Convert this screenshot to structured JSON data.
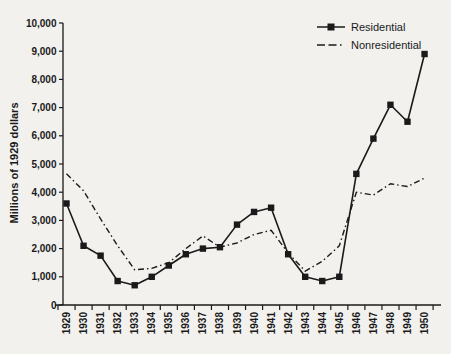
{
  "chart_data": {
    "type": "line",
    "title": "",
    "xlabel": "",
    "ylabel": "Millions of 1929 dollars",
    "ylim": [
      0,
      10000
    ],
    "ytick_step": 1000,
    "y_tick_labels": [
      "0",
      "1,000",
      "2,000",
      "3,000",
      "4,000",
      "5,000",
      "6,000",
      "7,000",
      "8,000",
      "9,000",
      "10,000"
    ],
    "categories": [
      "1929",
      "1930",
      "1931",
      "1932",
      "1933",
      "1934",
      "1935",
      "1936",
      "1937",
      "1938",
      "1939",
      "1940",
      "1941",
      "1942",
      "1943",
      "1944",
      "1945",
      "1946",
      "1947",
      "1948",
      "1949",
      "1950"
    ],
    "series": [
      {
        "name": "Residential",
        "line_style": "solid",
        "marker": "square",
        "values": [
          3600,
          2100,
          1750,
          850,
          700,
          1000,
          1400,
          1800,
          2000,
          2050,
          2850,
          3300,
          3450,
          1800,
          1000,
          850,
          1000,
          4650,
          5900,
          7100,
          6500,
          8900
        ]
      },
      {
        "name": "Nonresidential",
        "line_style": "dash-dot",
        "marker": "none",
        "values": [
          4650,
          4050,
          3050,
          2100,
          1250,
          1300,
          1500,
          2000,
          2450,
          2050,
          2200,
          2500,
          2650,
          1850,
          1200,
          1550,
          2100,
          4000,
          3900,
          4300,
          4200,
          4500
        ]
      }
    ],
    "legend_position": "top-right",
    "grid": false,
    "colors": {
      "line": "#1a1a1a",
      "background": "#f2f1ee"
    }
  }
}
